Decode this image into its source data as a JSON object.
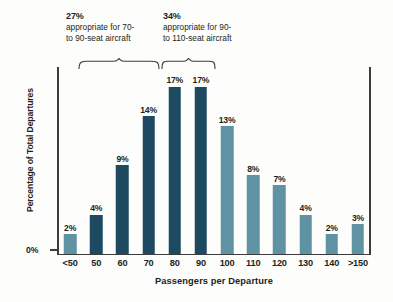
{
  "chart_data": {
    "type": "bar",
    "title": "",
    "xlabel": "Passengers per Departure",
    "ylabel": "Percentage of Total Departures",
    "ylim": [
      0,
      19
    ],
    "grid": false,
    "legend": "none",
    "y_tick_labels": [
      "0%"
    ],
    "categories": [
      "<50",
      "50",
      "60",
      "70",
      "80",
      "90",
      "100",
      "110",
      "120",
      "130",
      "140",
      ">150"
    ],
    "values": [
      2,
      4,
      9,
      14,
      17,
      17,
      13,
      8,
      7,
      4,
      2,
      3
    ],
    "value_labels": [
      "2%",
      "4%",
      "9%",
      "14%",
      "17%",
      "17%",
      "13%",
      "8%",
      "7%",
      "4%",
      "2%",
      "3%"
    ],
    "bar_colors": [
      "light",
      "dark",
      "dark",
      "dark",
      "dark",
      "dark",
      "light",
      "light",
      "light",
      "light",
      "light",
      "light"
    ],
    "colors": {
      "dark": "#1d4a60",
      "light": "#5f93a3",
      "axis": "#3c3c3c",
      "text": "#231f20",
      "background": "#fdfdfb"
    },
    "annotations": [
      {
        "pct": "27%",
        "line1": "appropriate for 70-",
        "line2": "to 90-seat aircraft",
        "spans_categories": [
          "50",
          "60",
          "70"
        ]
      },
      {
        "pct": "34%",
        "line1": "appropriate for 90-",
        "line2": "to 110-seat aircraft",
        "spans_categories": [
          "80",
          "90"
        ]
      }
    ]
  }
}
